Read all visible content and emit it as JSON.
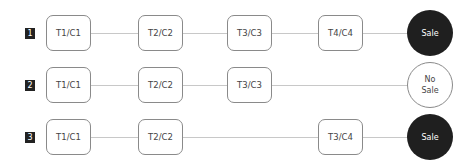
{
  "diagram": {
    "rows": [
      {
        "id": "1",
        "nodes": [
          "T1/C1",
          "T2/C2",
          "T3/C3",
          "T4/C4"
        ],
        "outcome": "Sale",
        "outcome_type": "sale"
      },
      {
        "id": "2",
        "nodes": [
          "T1/C1",
          "T2/C2",
          "T3/C3"
        ],
        "outcome": "No Sale",
        "outcome_line1": "No",
        "outcome_line2": "Sale",
        "outcome_type": "no-sale"
      },
      {
        "id": "3",
        "nodes": [
          "T1/C1",
          "T2/C2",
          "T3/C4"
        ],
        "outcome": "Sale",
        "outcome_type": "sale"
      }
    ],
    "colors": {
      "sale_fill": "#1f1f1f",
      "no_sale_fill": "#ffffff",
      "border": "#8a8a8a",
      "connector": "#c8c8c8",
      "badge": "#222222"
    }
  }
}
